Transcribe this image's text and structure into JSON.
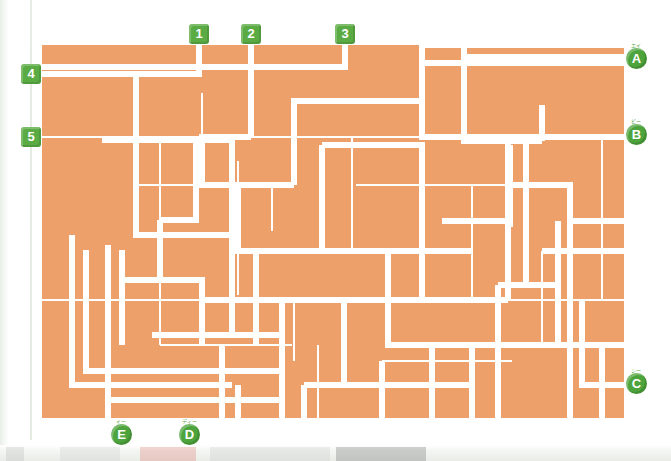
{
  "page": {
    "type": "maze-puzzle",
    "background_color": "#ffffff",
    "board_color": "#eda06a",
    "path_color": "#ffffff",
    "tag_color_number": "#5aab43",
    "tag_color_letter": "#4da33c"
  },
  "board": {
    "x": 42,
    "y": 45,
    "width": 582,
    "height": 373
  },
  "entrances": [
    {
      "label": "1",
      "name": "entrance-1",
      "x": 189,
      "y": 24,
      "connector_x": 199,
      "connector_y": 45,
      "side": "top"
    },
    {
      "label": "2",
      "name": "entrance-2",
      "x": 241,
      "y": 24,
      "connector_x": 251,
      "connector_y": 45,
      "side": "top"
    },
    {
      "label": "3",
      "name": "entrance-3",
      "x": 335,
      "y": 24,
      "connector_x": 345,
      "connector_y": 45,
      "side": "top"
    },
    {
      "label": "4",
      "name": "entrance-4",
      "x": 21,
      "y": 64,
      "connector_x": 42,
      "connector_y": 74,
      "side": "left"
    },
    {
      "label": "5",
      "name": "entrance-5",
      "x": 21,
      "y": 127,
      "connector_x": 42,
      "connector_y": 137,
      "side": "left"
    }
  ],
  "exits": [
    {
      "label": "A",
      "furigana": "エイ",
      "name": "exit-a",
      "x": 626,
      "y": 48,
      "side": "right"
    },
    {
      "label": "B",
      "furigana": "ビー",
      "name": "exit-b",
      "x": 626,
      "y": 124,
      "side": "right"
    },
    {
      "label": "C",
      "furigana": "シー",
      "name": "exit-c",
      "x": 626,
      "y": 373,
      "side": "right"
    },
    {
      "label": "D",
      "furigana": "ディー",
      "name": "exit-d",
      "x": 179,
      "y": 424,
      "side": "bottom"
    },
    {
      "label": "E",
      "furigana": "イー",
      "name": "exit-e",
      "x": 111,
      "y": 424,
      "side": "bottom"
    }
  ],
  "maze_paths": {
    "thick_stroke": 6,
    "thin_stroke": 2,
    "note": "White corridor lines drawn over the orange board; coordinates are relative to the board origin."
  }
}
